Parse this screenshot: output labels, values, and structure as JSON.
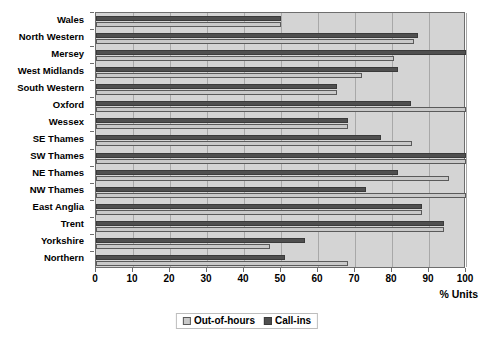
{
  "chart_data": {
    "type": "bar",
    "orientation": "horizontal",
    "title": "",
    "xlabel": "% Units",
    "ylabel": "",
    "xlim": [
      0,
      100
    ],
    "xticks": [
      0,
      10,
      20,
      30,
      40,
      50,
      60,
      70,
      80,
      90,
      100
    ],
    "grid": true,
    "legend_position": "bottom-center",
    "categories": [
      "Wales",
      "North Western",
      "Mersey",
      "West Midlands",
      "South Western",
      "Oxford",
      "Wessex",
      "SE Thames",
      "SW Thames",
      "NE Thames",
      "NW Thames",
      "East Anglia",
      "Trent",
      "Yorkshire",
      "Northern"
    ],
    "series": [
      {
        "name": "Out-of-hours",
        "color": "#c9c9c9",
        "values": [
          50,
          86,
          80.5,
          72,
          65,
          100,
          68,
          85.5,
          100,
          95.5,
          100,
          88,
          94,
          47,
          68
        ]
      },
      {
        "name": "Call-ins",
        "color": "#4f4f4f",
        "values": [
          50,
          87,
          100,
          81.5,
          65,
          85,
          68,
          77,
          100,
          81.5,
          73,
          88,
          94,
          56.5,
          51
        ]
      }
    ]
  },
  "axis": {
    "x_title": "% Units",
    "tick_labels": [
      "0",
      "10",
      "20",
      "30",
      "40",
      "50",
      "60",
      "70",
      "80",
      "90",
      "100"
    ]
  },
  "legend": {
    "items": [
      {
        "label": "Out-of-hours",
        "swatch": "out"
      },
      {
        "label": "Call-ins",
        "swatch": "call"
      }
    ]
  },
  "caption": {
    "text": ""
  },
  "colors": {
    "plot_background": "#d4d4d4",
    "gridline": "#a8a8a8",
    "axis": "#6e6e6e",
    "out_of_hours": "#c9c9c9",
    "call_ins": "#4f4f4f"
  }
}
